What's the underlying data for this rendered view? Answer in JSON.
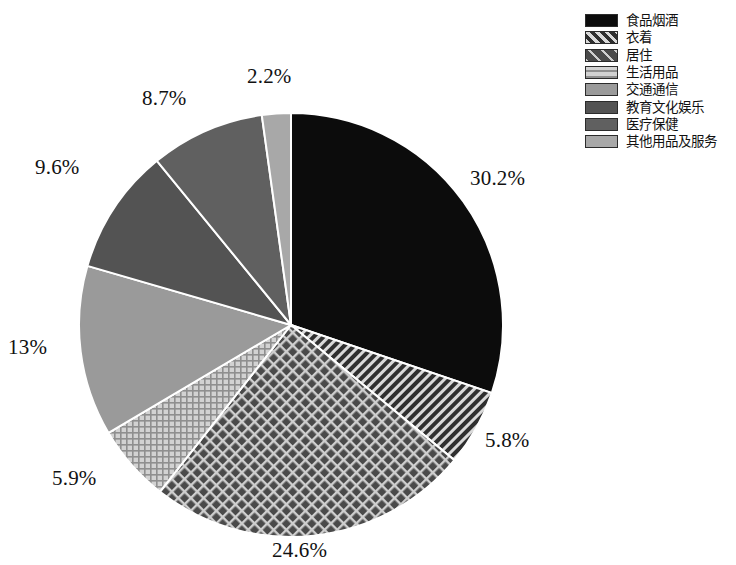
{
  "chart_data": {
    "type": "pie",
    "title": "",
    "subtitle": "",
    "xlabel": "",
    "ylabel": "",
    "legend_position": "top-right",
    "grid": false,
    "start_angle_deg": 0,
    "direction": "clockwise",
    "categories": [
      "食品烟酒",
      "衣着",
      "居住",
      "生活用品",
      "交通通信",
      "教育文化娱乐",
      "医疗保健",
      "其他用品及服务"
    ],
    "values": [
      30.2,
      5.8,
      24.6,
      5.9,
      13,
      9.6,
      8.7,
      2.2
    ],
    "labels": [
      "30.2%",
      "5.8%",
      "24.6%",
      "5.9%",
      "13%",
      "9.6%",
      "8.7%",
      "2.2%"
    ],
    "slices": [
      {
        "name": "食品烟酒",
        "value": 30.2,
        "label": "30.2%",
        "fill": "#0c0c0c",
        "pattern": "solid",
        "label_x": 470,
        "label_y": 166
      },
      {
        "name": "衣着",
        "value": 5.8,
        "label": "5.8%",
        "fill": "#2a2a2a",
        "pattern": "diagonal-stripes",
        "label_x": 485,
        "label_y": 428
      },
      {
        "name": "居住",
        "value": 24.6,
        "label": "24.6%",
        "fill": "#474747",
        "pattern": "diagonal-crosshatch",
        "label_x": 272,
        "label_y": 538
      },
      {
        "name": "生活用品",
        "value": 5.9,
        "label": "5.9%",
        "fill": "#b0b0b0",
        "pattern": "fine-grid",
        "label_x": 52,
        "label_y": 466
      },
      {
        "name": "交通通信",
        "value": 13,
        "label": "13%",
        "fill": "#9a9a9a",
        "pattern": "solid",
        "label_x": 8,
        "label_y": 335
      },
      {
        "name": "教育文化娱乐",
        "value": 9.6,
        "label": "9.6%",
        "fill": "#535353",
        "pattern": "solid",
        "label_x": 35,
        "label_y": 155
      },
      {
        "name": "医疗保健",
        "value": 8.7,
        "label": "8.7%",
        "fill": "#606060",
        "pattern": "solid",
        "label_x": 142,
        "label_y": 86
      },
      {
        "name": "其他用品及服务",
        "value": 2.2,
        "label": "2.2%",
        "fill": "#a8a8a8",
        "pattern": "solid",
        "label_x": 247,
        "label_y": 64
      }
    ]
  },
  "legend": {
    "items": [
      {
        "label": "食品烟酒",
        "swatch": "swatch-solid-black"
      },
      {
        "label": "衣着",
        "swatch": "swatch-diagonal-stripes"
      },
      {
        "label": "居住",
        "swatch": "swatch-diagonal-crosshatch"
      },
      {
        "label": "生活用品",
        "swatch": "swatch-fine-grid"
      },
      {
        "label": "交通通信",
        "swatch": "swatch-solid-mid-gray"
      },
      {
        "label": "教育文化娱乐",
        "swatch": "swatch-solid-dark-gray"
      },
      {
        "label": "医疗保健",
        "swatch": "swatch-solid-dark-gray-2"
      },
      {
        "label": "其他用品及服务",
        "swatch": "swatch-solid-light-gray"
      }
    ]
  },
  "geometry": {
    "center_x": 291,
    "center_y": 325,
    "radius": 212
  }
}
